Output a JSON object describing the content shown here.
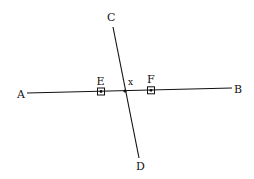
{
  "diagram": {
    "colors": {
      "line": "#111111",
      "background": "#ffffff"
    },
    "lines": [
      {
        "id": "AB",
        "from": "A",
        "to": "B",
        "x1": 27,
        "y1": 93,
        "x2": 232,
        "y2": 88
      },
      {
        "id": "CD",
        "from": "C",
        "to": "D",
        "x1": 113,
        "y1": 27,
        "x2": 139,
        "y2": 158
      }
    ],
    "labels": {
      "A": "A",
      "B": "B",
      "C": "C",
      "D": "D",
      "E": "E",
      "F": "F",
      "x": "x"
    },
    "points": {
      "intersection": {
        "label": "x",
        "cx": 125,
        "cy": 91
      },
      "E": {
        "label": "E",
        "cx": 101,
        "cy": 91.5,
        "marker": "boxed-dot"
      },
      "F": {
        "label": "F",
        "cx": 151,
        "cy": 90.3,
        "marker": "boxed-dot"
      }
    }
  }
}
